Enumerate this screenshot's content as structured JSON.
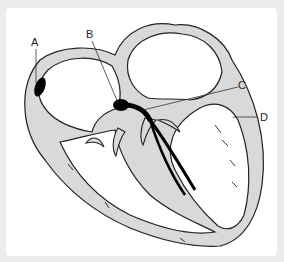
{
  "diagram": {
    "labels": [
      {
        "id": "A",
        "text": "A",
        "points_to": "sinoatrial node"
      },
      {
        "id": "B",
        "text": "B",
        "points_to": "atrioventricular node"
      },
      {
        "id": "C",
        "text": "C",
        "points_to": "bundle of His"
      },
      {
        "id": "D",
        "text": "D",
        "points_to": "Purkinje fibres"
      }
    ],
    "colors": {
      "background": "#ececec",
      "card": "#ffffff",
      "tissue_fill": "#d9d9d9",
      "outline": "#222222",
      "conduction": "#000000"
    }
  }
}
